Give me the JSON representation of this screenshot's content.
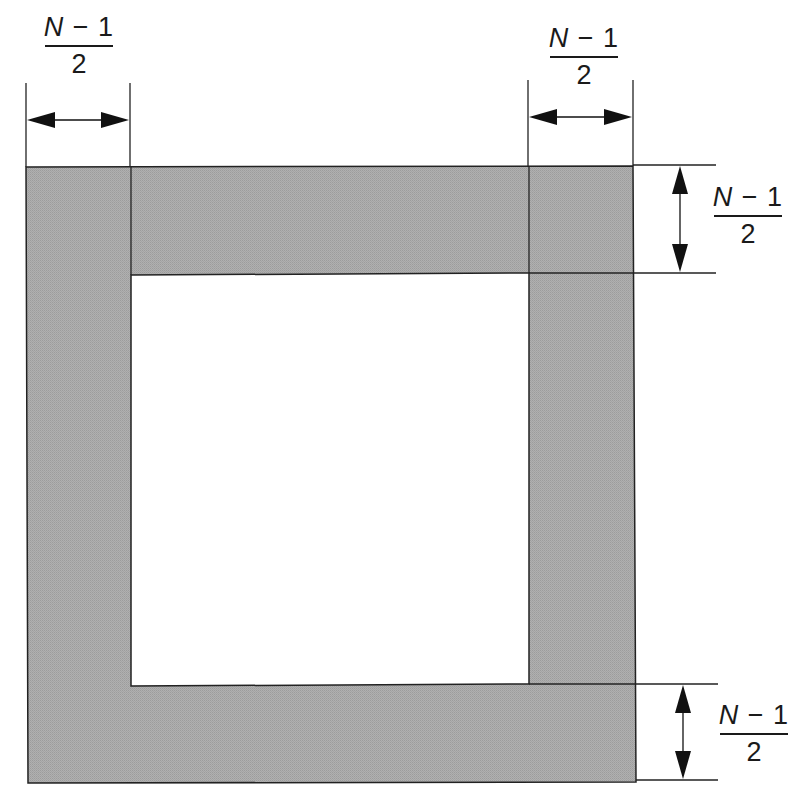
{
  "diagram": {
    "fill_color": "#a9a9a9",
    "line_color": "#1a1a1a",
    "labels": {
      "top_left": {
        "numerator_var": "N",
        "numerator_rest": " − 1",
        "denominator": "2"
      },
      "top_right": {
        "numerator_var": "N",
        "numerator_rest": " − 1",
        "denominator": "2"
      },
      "right_top": {
        "numerator_var": "N",
        "numerator_rest": " − 1",
        "denominator": "2"
      },
      "right_bottom": {
        "numerator_var": "N",
        "numerator_rest": " − 1",
        "denominator": "2"
      }
    }
  }
}
